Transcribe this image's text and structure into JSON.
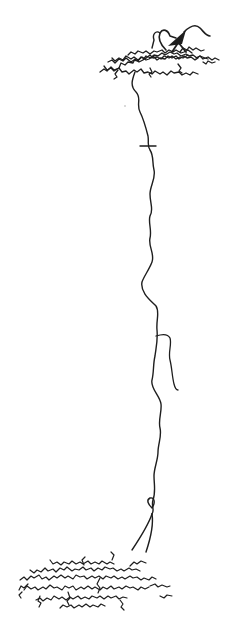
{
  "figure": {
    "background": "#ffffff",
    "ink_color": "#1e1e1e",
    "parts": [
      {
        "name": "soma",
        "description": "dark triangular cell body near top right"
      },
      {
        "name": "upper-dendritic-arbor",
        "description": "dense horizontal tangled arbor at top"
      },
      {
        "name": "axon",
        "description": "long wavy vertical process descending through the image"
      },
      {
        "name": "axon-collateral",
        "description": "short side branch at mid-height ending freely"
      },
      {
        "name": "lower-terminal-arbor",
        "description": "dense tangled arbor at bottom"
      }
    ]
  }
}
